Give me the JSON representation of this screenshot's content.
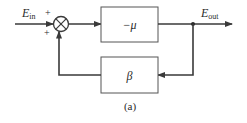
{
  "diagram": {
    "type": "feedback-block-diagram",
    "caption": "(a)",
    "input": {
      "label": "E",
      "subscript": "in"
    },
    "output": {
      "label": "E",
      "subscript": "out"
    },
    "summing_junction": {
      "signs": [
        "+",
        "+"
      ]
    },
    "forward_block": {
      "label": "−μ"
    },
    "feedback_block": {
      "label": "β"
    },
    "colors": {
      "line": "#3a3a3a",
      "box": "#555555",
      "text": "#2a2a2a",
      "background": "#ffffff"
    }
  }
}
